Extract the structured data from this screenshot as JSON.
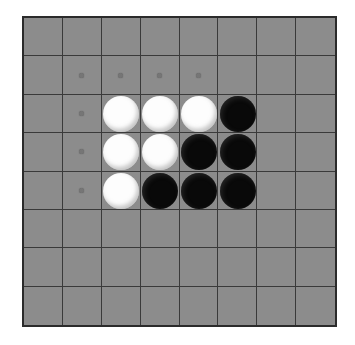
{
  "board": {
    "name": "othello-reversi-board",
    "rows": 8,
    "columns": 8,
    "background_color": "#8c8c8c",
    "grid_line_color": "#3a3a3a",
    "border_color": "#2b2b2b",
    "page_background_color": "#ffffff",
    "cell_dot_color": "#767676",
    "colors": {
      "white_stone": "#fdfdfd",
      "black_stone": "#090909"
    },
    "legend": [
      {
        "key": "W",
        "label": "white-stone"
      },
      {
        "key": "B",
        "label": "black-stone"
      },
      {
        "key": ".",
        "label": "empty-cell"
      }
    ],
    "cell_markers": [
      {
        "row": 1,
        "col": 1
      },
      {
        "row": 1,
        "col": 2
      },
      {
        "row": 1,
        "col": 3
      },
      {
        "row": 1,
        "col": 4
      },
      {
        "row": 2,
        "col": 1
      },
      {
        "row": 3,
        "col": 1
      },
      {
        "row": 4,
        "col": 1
      }
    ],
    "grid": [
      [
        ".",
        ".",
        ".",
        ".",
        ".",
        ".",
        ".",
        "."
      ],
      [
        ".",
        ".",
        ".",
        ".",
        ".",
        ".",
        ".",
        "."
      ],
      [
        ".",
        ".",
        "W",
        "W",
        "W",
        "B",
        ".",
        "."
      ],
      [
        ".",
        ".",
        "W",
        "W",
        "B",
        "B",
        ".",
        "."
      ],
      [
        ".",
        ".",
        "W",
        "B",
        "B",
        "B",
        ".",
        "."
      ],
      [
        ".",
        ".",
        ".",
        ".",
        ".",
        ".",
        ".",
        "."
      ],
      [
        ".",
        ".",
        ".",
        ".",
        ".",
        ".",
        ".",
        "."
      ],
      [
        ".",
        ".",
        ".",
        ".",
        ".",
        ".",
        ".",
        "."
      ]
    ],
    "stone_counts": {
      "white": 6,
      "black": 6,
      "total": 12
    }
  },
  "chart_data": {
    "type": "heatmap",
    "title": "",
    "xlabel": "",
    "ylabel": "",
    "categories": [
      "1",
      "2",
      "3",
      "4",
      "5",
      "6",
      "7",
      "8"
    ],
    "rows": [
      "1",
      "2",
      "3",
      "4",
      "5",
      "6",
      "7",
      "8"
    ],
    "values": [
      [
        0,
        0,
        0,
        0,
        0,
        0,
        0,
        0
      ],
      [
        0,
        0,
        0,
        0,
        0,
        0,
        0,
        0
      ],
      [
        0,
        0,
        1,
        1,
        1,
        2,
        0,
        0
      ],
      [
        0,
        0,
        1,
        1,
        2,
        2,
        0,
        0
      ],
      [
        0,
        0,
        1,
        2,
        2,
        2,
        0,
        0
      ],
      [
        0,
        0,
        0,
        0,
        0,
        0,
        0,
        0
      ],
      [
        0,
        0,
        0,
        0,
        0,
        0,
        0,
        0
      ],
      [
        0,
        0,
        0,
        0,
        0,
        0,
        0,
        0
      ]
    ],
    "value_legend": {
      "0": "empty",
      "1": "white",
      "2": "black"
    }
  }
}
